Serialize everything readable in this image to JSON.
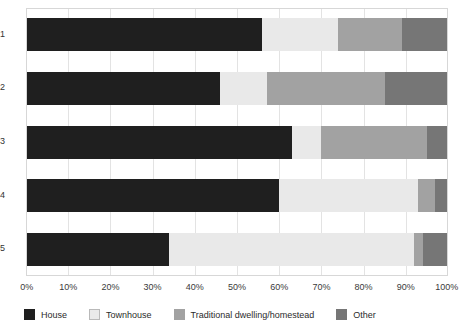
{
  "chart_data": {
    "type": "bar",
    "orientation": "horizontal",
    "stacked": true,
    "normalized_percent": true,
    "title": "",
    "subtitle": "",
    "xlabel": "",
    "ylabel": "",
    "xlim": [
      0,
      100
    ],
    "xtick_labels": [
      "0%",
      "10%",
      "20%",
      "30%",
      "40%",
      "50%",
      "60%",
      "70%",
      "80%",
      "90%",
      "100%"
    ],
    "xtick_values": [
      0,
      10,
      20,
      30,
      40,
      50,
      60,
      70,
      80,
      90,
      100
    ],
    "grid": "vertical",
    "legend_position": "bottom",
    "categories": [
      "1",
      "2",
      "3",
      "4",
      "5"
    ],
    "series": [
      {
        "name": "House",
        "color": "#1f1f1f",
        "values": [
          56,
          46,
          63,
          60,
          34
        ]
      },
      {
        "name": "Townhouse",
        "color": "#e9e9e9",
        "values": [
          18,
          11,
          7,
          33,
          58
        ]
      },
      {
        "name": "Traditional dwelling/homestead",
        "color": "#a2a2a2",
        "values": [
          15,
          28,
          25,
          4,
          2
        ]
      },
      {
        "name": "Other",
        "color": "#767676",
        "values": [
          11,
          15,
          5,
          3,
          6
        ]
      }
    ],
    "legend_entries": [
      {
        "label": "House",
        "color": "#1f1f1f"
      },
      {
        "label": "Townhouse",
        "color": "#e9e9e9"
      },
      {
        "label": "Traditional dwelling/homestead",
        "color": "#a2a2a2"
      },
      {
        "label": "Other",
        "color": "#767676"
      }
    ]
  }
}
